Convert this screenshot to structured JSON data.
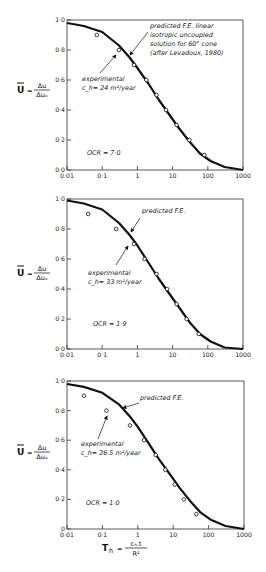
{
  "chart_data": [
    {
      "type": "line",
      "title": "",
      "xlabel": "T_h = c_h.t / R^2",
      "ylabel": "U = Δu / Δu_o",
      "xscale": "log",
      "xlim": [
        0.01,
        1000
      ],
      "ylim": [
        0.0,
        1.0
      ],
      "x_ticks": [
        "0·01",
        "0·1",
        "1",
        "10",
        "100",
        "1000"
      ],
      "y_ticks": [
        "0·0",
        "0·2",
        "0·4",
        "0·6",
        "0·8",
        "1·0"
      ],
      "grid": false,
      "annotations": {
        "predicted": [
          "predicted  F.E. linear",
          "isotropic uncoupled",
          "solution  for 60° cone",
          "(after Levadoux, 1980)"
        ],
        "experimental": [
          "experimental",
          "c_h= 24 m²/year"
        ],
        "ocr": "OCR   = 7·0"
      },
      "series": [
        {
          "name": "predicted F.E.",
          "style": "line",
          "x": [
            0.01,
            0.03,
            0.1,
            0.3,
            0.6,
            1,
            2,
            4,
            8,
            15,
            30,
            60,
            120,
            300,
            1000
          ],
          "y": [
            0.98,
            0.96,
            0.92,
            0.83,
            0.75,
            0.68,
            0.58,
            0.47,
            0.37,
            0.28,
            0.19,
            0.11,
            0.06,
            0.02,
            0.0
          ]
        },
        {
          "name": "experimental",
          "style": "markers",
          "x": [
            0.07,
            0.3,
            0.8,
            1.8,
            3.5,
            6.5,
            13,
            30,
            80
          ],
          "y": [
            0.9,
            0.8,
            0.7,
            0.6,
            0.5,
            0.4,
            0.3,
            0.2,
            0.1
          ]
        }
      ]
    },
    {
      "type": "line",
      "title": "",
      "xlabel": "T_h",
      "ylabel": "U = Δu / Δu_o",
      "xscale": "log",
      "xlim": [
        0.01,
        1000
      ],
      "ylim": [
        0.0,
        1.0
      ],
      "x_ticks": [
        "0·01",
        "0·1",
        "1",
        "10",
        "100",
        "1000"
      ],
      "y_ticks": [
        "0·0",
        "0·2",
        "0·4",
        "0·6",
        "0·8",
        "1·0"
      ],
      "grid": false,
      "annotations": {
        "predicted": [
          "predicted  F.E."
        ],
        "experimental": [
          "experimental",
          "c_h= 33 m²/year"
        ],
        "ocr": "OCR  = 1·9"
      },
      "series": [
        {
          "name": "predicted F.E.",
          "style": "line",
          "x": [
            0.01,
            0.03,
            0.1,
            0.3,
            0.6,
            1,
            2,
            4,
            8,
            15,
            30,
            60,
            120,
            300,
            1000
          ],
          "y": [
            0.99,
            0.97,
            0.93,
            0.84,
            0.76,
            0.69,
            0.58,
            0.47,
            0.37,
            0.28,
            0.18,
            0.1,
            0.05,
            0.01,
            0.0
          ]
        },
        {
          "name": "experimental",
          "style": "markers",
          "x": [
            0.04,
            0.25,
            0.8,
            1.6,
            3.5,
            7,
            13,
            25,
            55
          ],
          "y": [
            0.9,
            0.8,
            0.7,
            0.6,
            0.5,
            0.4,
            0.3,
            0.2,
            0.1
          ]
        }
      ]
    },
    {
      "type": "line",
      "title": "",
      "xlabel": "T_h = c_h.t / R^2",
      "ylabel": "U = Δu / Δu_o",
      "xscale": "log",
      "xlim": [
        0.01,
        1000
      ],
      "ylim": [
        0.0,
        1.0
      ],
      "x_ticks": [
        "0·01",
        "0·1",
        "1",
        "10",
        "100",
        "1000"
      ],
      "y_ticks": [
        "0",
        "0·2",
        "0·4",
        "0·6",
        "0·8",
        "1·0"
      ],
      "grid": false,
      "annotations": {
        "predicted": [
          "predicted  F.E."
        ],
        "experimental": [
          "experimental",
          "c_h= 26.5 m²/year"
        ],
        "ocr": "OCR = 1·0"
      },
      "series": [
        {
          "name": "predicted F.E.",
          "style": "line",
          "x": [
            0.01,
            0.03,
            0.1,
            0.3,
            0.6,
            1,
            2,
            4,
            8,
            15,
            30,
            60,
            120,
            300,
            1000
          ],
          "y": [
            0.98,
            0.96,
            0.92,
            0.84,
            0.76,
            0.69,
            0.58,
            0.47,
            0.37,
            0.28,
            0.19,
            0.11,
            0.06,
            0.02,
            0.0
          ]
        },
        {
          "name": "experimental",
          "style": "markers",
          "x": [
            0.03,
            0.13,
            0.6,
            1.5,
            3.2,
            6,
            11,
            20,
            45
          ],
          "y": [
            0.9,
            0.8,
            0.7,
            0.6,
            0.5,
            0.4,
            0.3,
            0.2,
            0.1
          ]
        }
      ]
    }
  ],
  "layout": {
    "panels": [
      {
        "x0": 67,
        "x1": 243,
        "y_top": 20,
        "y_bottom": 170,
        "ylabel_y": 90
      },
      {
        "x0": 67,
        "x1": 243,
        "y_top": 199,
        "y_bottom": 349,
        "ylabel_y": 273
      },
      {
        "x0": 67,
        "x1": 244,
        "y_top": 381,
        "y_bottom": 529,
        "ylabel_y": 452
      }
    ],
    "ann_pos": [
      {
        "pred": [
          150,
          28
        ],
        "pred_arrow": [
          [
            148,
            32
          ],
          [
            130,
            55
          ]
        ],
        "exp": [
          82,
          81
        ],
        "exp_arrow": [
          [
            100,
            73
          ],
          [
            116,
            55
          ]
        ],
        "ocr": [
          87,
          155
        ]
      },
      {
        "pred": [
          142,
          213
        ],
        "pred_arrow": [
          [
            140,
            218
          ],
          [
            131,
            232
          ]
        ],
        "exp": [
          88,
          275
        ],
        "exp_arrow": [
          [
            116,
            265
          ],
          [
            128,
            246
          ]
        ],
        "ocr": [
          93,
          326
        ]
      },
      {
        "pred": [
          140,
          400
        ],
        "pred_arrow": [
          [
            139,
            403
          ],
          [
            123,
            408
          ]
        ],
        "exp": [
          81,
          446
        ],
        "exp_arrow": [
          [
            98,
            439
          ],
          [
            107,
            416
          ]
        ],
        "ocr": [
          86,
          505
        ]
      }
    ],
    "xlabel": {
      "x": 130,
      "y": 548
    }
  }
}
